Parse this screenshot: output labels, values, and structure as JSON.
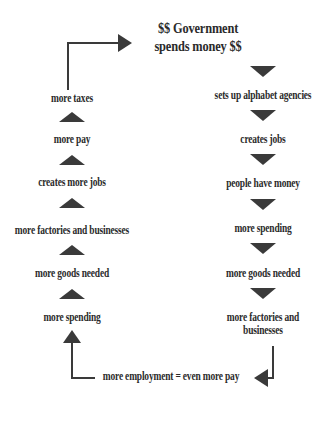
{
  "diagram": {
    "title_line1": "$$ Government",
    "title_line2": "spends money $$",
    "accent_color": "#3a3a3a",
    "text_color": "#2b2b2b",
    "background_color": "#ffffff",
    "left_column": [
      {
        "label": "more taxes"
      },
      {
        "label": "more pay"
      },
      {
        "label": "creates more jobs"
      },
      {
        "label": "more factories and businesses"
      },
      {
        "label": "more goods needed"
      },
      {
        "label": "more spending"
      }
    ],
    "right_column": [
      {
        "label": "sets up alphabet agencies"
      },
      {
        "label": "creates jobs"
      },
      {
        "label": "people have money"
      },
      {
        "label": "more spending"
      },
      {
        "label": "more goods needed"
      },
      {
        "label": "more factories and",
        "label2": "businesses"
      }
    ],
    "footer": "more employment = even more pay",
    "connector_names": {
      "top_left_elbow": "arrow-more-taxes-to-government",
      "bottom_left_elbow": "arrow-footer-to-more-spending",
      "bottom_right_elbow": "arrow-factories-to-footer"
    }
  }
}
